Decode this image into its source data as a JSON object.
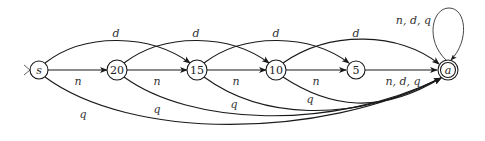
{
  "diagram": {
    "type": "finite-automaton",
    "nodes": [
      {
        "id": "s",
        "label": "s",
        "italic": true,
        "x": 39,
        "y": 70,
        "start": true,
        "accept": false
      },
      {
        "id": "20",
        "label": "20",
        "italic": false,
        "x": 117,
        "y": 70,
        "start": false,
        "accept": false
      },
      {
        "id": "15",
        "label": "15",
        "italic": false,
        "x": 197,
        "y": 70,
        "start": false,
        "accept": false
      },
      {
        "id": "10",
        "label": "10",
        "italic": false,
        "x": 276,
        "y": 70,
        "start": false,
        "accept": false
      },
      {
        "id": "5",
        "label": "5",
        "italic": false,
        "x": 356,
        "y": 70,
        "start": false,
        "accept": false
      },
      {
        "id": "a",
        "label": "a",
        "italic": true,
        "x": 448,
        "y": 70,
        "start": false,
        "accept": true
      }
    ],
    "edges": {
      "n": [
        {
          "from": "s",
          "to": "20",
          "label": "n"
        },
        {
          "from": "20",
          "to": "15",
          "label": "n"
        },
        {
          "from": "15",
          "to": "10",
          "label": "n"
        },
        {
          "from": "10",
          "to": "5",
          "label": "n"
        },
        {
          "from": "5",
          "to": "a",
          "label": "n, d, q"
        }
      ],
      "d": [
        {
          "from": "s",
          "to": "15",
          "label": "d"
        },
        {
          "from": "20",
          "to": "10",
          "label": "d"
        },
        {
          "from": "15",
          "to": "5",
          "label": "d"
        },
        {
          "from": "10",
          "to": "a",
          "label": "d"
        }
      ],
      "q": [
        {
          "from": "s",
          "to": "a",
          "label": "q"
        },
        {
          "from": "20",
          "to": "a",
          "label": "q"
        },
        {
          "from": "15",
          "to": "a",
          "label": "q"
        },
        {
          "from": "10",
          "to": "a",
          "label": "q"
        }
      ],
      "self_loop": {
        "node": "a",
        "label": "n, d, q"
      }
    },
    "labels": {
      "s": "s",
      "n20": "20",
      "n15": "15",
      "n10": "10",
      "n5": "5",
      "a": "a",
      "n_s_20": "n",
      "n_20_15": "n",
      "n_15_10": "n",
      "n_10_5": "n",
      "ndq_5_a": "n, d, q",
      "d_s_15": "d",
      "d_20_10": "d",
      "d_15_5": "d",
      "d_10_a": "d",
      "q_s_a": "q",
      "q_20_a": "q",
      "q_15_a": "q",
      "q_10_a": "q",
      "loop_a": "n, d, q"
    }
  }
}
